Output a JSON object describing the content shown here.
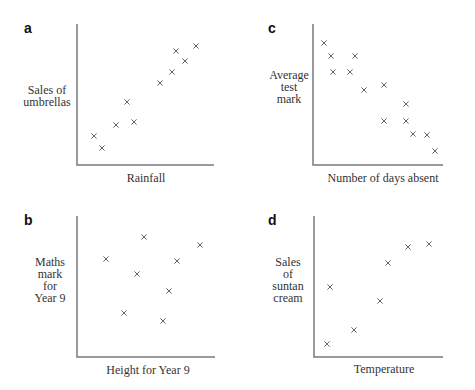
{
  "chart_data": [
    {
      "id": "a",
      "type": "scatter",
      "title": "a",
      "xlabel": "Rainfall",
      "ylabel": "Sales of umbrellas",
      "ylabel_lines": [
        "Sales of",
        "umbrellas"
      ],
      "marker": "x",
      "correlation": "positive",
      "axes_px": {
        "x0": 77,
        "y0": 165,
        "x1": 214,
        "ytop": 24
      },
      "label_pos": {
        "letter": [
          24,
          28
        ],
        "ylabel": [
          30,
          96
        ],
        "xlabel": [
          148,
          178
        ]
      },
      "points_px": [
        [
          94,
          136
        ],
        [
          102,
          148
        ],
        [
          116,
          125
        ],
        [
          127,
          102
        ],
        [
          134,
          122
        ],
        [
          160,
          83
        ],
        [
          172,
          72
        ],
        [
          176,
          51
        ],
        [
          185,
          61
        ],
        [
          196,
          46
        ]
      ],
      "x": [
        0.12,
        0.18,
        0.28,
        0.37,
        0.42,
        0.61,
        0.69,
        0.72,
        0.79,
        0.87
      ],
      "y": [
        0.21,
        0.12,
        0.28,
        0.45,
        0.3,
        0.58,
        0.66,
        0.81,
        0.74,
        0.84
      ],
      "xlim": [
        0,
        1
      ],
      "ylim": [
        0,
        1
      ],
      "grid": false,
      "ticks": false
    },
    {
      "id": "b",
      "type": "scatter",
      "title": "b",
      "xlabel": "Height for Year 9",
      "ylabel": "Maths mark for Year 9",
      "ylabel_lines": [
        "Maths",
        "mark",
        "for",
        "Year 9"
      ],
      "marker": "x",
      "correlation": "none",
      "axes_px": {
        "x0": 77,
        "y0": 357,
        "x1": 215,
        "ytop": 216
      },
      "label_pos": {
        "letter": [
          24,
          219
        ],
        "ylabel": [
          30,
          262
        ],
        "xlabel": [
          148,
          370
        ]
      },
      "points_px": [
        [
          106,
          259
        ],
        [
          144,
          237
        ],
        [
          137,
          274
        ],
        [
          177,
          261
        ],
        [
          169,
          291
        ],
        [
          200,
          245
        ],
        [
          124,
          313
        ],
        [
          163,
          321
        ]
      ],
      "x": [
        0.21,
        0.49,
        0.43,
        0.72,
        0.67,
        0.89,
        0.34,
        0.62
      ],
      "y": [
        0.7,
        0.85,
        0.59,
        0.68,
        0.47,
        0.79,
        0.31,
        0.26
      ],
      "xlim": [
        0,
        1
      ],
      "ylim": [
        0,
        1
      ],
      "grid": false,
      "ticks": false
    },
    {
      "id": "c",
      "type": "scatter",
      "title": "c",
      "xlabel": "Number of days absent",
      "ylabel": "Average test mark",
      "ylabel_lines": [
        "Average",
        "test",
        "mark"
      ],
      "marker": "x",
      "correlation": "negative",
      "axes_px": {
        "x0": 313,
        "y0": 165,
        "x1": 443,
        "ytop": 24
      },
      "label_pos": {
        "letter": [
          269,
          28
        ],
        "ylabel": [
          268,
          70
        ],
        "xlabel": [
          381,
          178
        ]
      },
      "points_px": [
        [
          324,
          43
        ],
        [
          331,
          56
        ],
        [
          355,
          56
        ],
        [
          333,
          72
        ],
        [
          350,
          72
        ],
        [
          364,
          90
        ],
        [
          384,
          85
        ],
        [
          406,
          104
        ],
        [
          384,
          121
        ],
        [
          406,
          121
        ],
        [
          413,
          134
        ],
        [
          427,
          135
        ],
        [
          435,
          151
        ]
      ],
      "x": [
        0.08,
        0.14,
        0.32,
        0.15,
        0.28,
        0.39,
        0.55,
        0.72,
        0.55,
        0.72,
        0.77,
        0.88,
        0.94
      ],
      "y": [
        0.87,
        0.77,
        0.77,
        0.66,
        0.66,
        0.53,
        0.57,
        0.43,
        0.31,
        0.31,
        0.22,
        0.21,
        0.1
      ],
      "xlim": [
        0,
        1
      ],
      "ylim": [
        0,
        1
      ],
      "grid": false,
      "ticks": false
    },
    {
      "id": "d",
      "type": "scatter",
      "title": "d",
      "xlabel": "Temperature",
      "ylabel": "Sales of suntan cream",
      "ylabel_lines": [
        "Sales",
        "of",
        "suntan",
        "cream"
      ],
      "marker": "x",
      "correlation": "positive",
      "axes_px": {
        "x0": 314,
        "y0": 357,
        "x1": 443,
        "ytop": 216
      },
      "label_pos": {
        "letter": [
          269,
          219
        ],
        "ylabel": [
          268,
          262
        ],
        "xlabel": [
          384,
          369
        ]
      },
      "points_px": [
        [
          327,
          344
        ],
        [
          330,
          287
        ],
        [
          354,
          330
        ],
        [
          380,
          301
        ],
        [
          388,
          263
        ],
        [
          408,
          247
        ],
        [
          429,
          244
        ]
      ],
      "x": [
        0.1,
        0.12,
        0.31,
        0.51,
        0.57,
        0.73,
        0.89
      ],
      "y": [
        0.09,
        0.5,
        0.19,
        0.4,
        0.67,
        0.79,
        0.81
      ],
      "xlim": [
        0,
        1
      ],
      "ylim": [
        0,
        1
      ],
      "grid": false,
      "ticks": false
    }
  ],
  "panels": {
    "a": {
      "letter": "a",
      "xlabel": "Rainfall",
      "ylabel_1": "Sales of",
      "ylabel_2": "umbrellas"
    },
    "b": {
      "letter": "b",
      "xlabel": "Height for Year 9",
      "ylabel_1": "Maths",
      "ylabel_2": "mark",
      "ylabel_3": "for",
      "ylabel_4": "Year 9"
    },
    "c": {
      "letter": "c",
      "xlabel": "Number of days absent",
      "ylabel_1": "Average",
      "ylabel_2": "test",
      "ylabel_3": "mark"
    },
    "d": {
      "letter": "d",
      "xlabel": "Temperature",
      "ylabel_1": "Sales",
      "ylabel_2": "of",
      "ylabel_3": "suntan",
      "ylabel_4": "cream"
    }
  },
  "colors": {
    "axis": "#7a7a7a",
    "marker": "#555555",
    "text": "#333333",
    "background": "#ffffff"
  }
}
